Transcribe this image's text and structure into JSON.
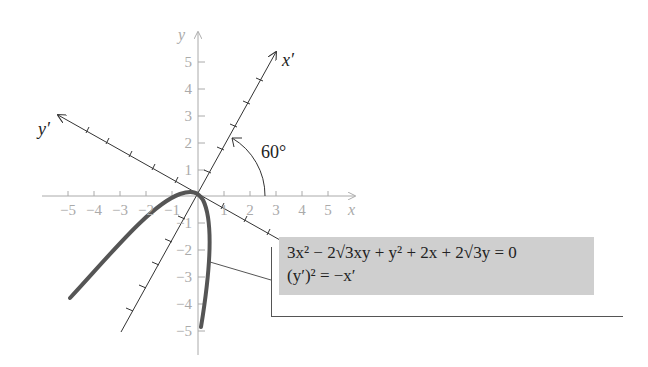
{
  "diagram": {
    "axes": {
      "x_label": "x",
      "y_label": "y",
      "x_prime_label": "x′",
      "y_prime_label": "y′",
      "x_ticks": [
        "−5",
        "−4",
        "−3",
        "−2",
        "−1",
        "1",
        "2",
        "3",
        "4",
        "5"
      ],
      "y_ticks": [
        "5",
        "4",
        "3",
        "2",
        "1",
        "−1",
        "−2",
        "−3",
        "−4",
        "−5"
      ]
    },
    "angle_label": "60°",
    "equation_box": {
      "line1": "3x² − 2√3xy + y² + 2x + 2√3y = 0",
      "line2": "(y′)² = −x′"
    },
    "colors": {
      "axis": "#aaaaaa",
      "rotated_axis": "#333333",
      "curve": "#555555",
      "box": "#cfcfcf"
    }
  }
}
